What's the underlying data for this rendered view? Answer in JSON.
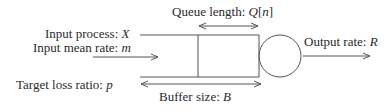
{
  "labels": {
    "input_process": {
      "text": "Input process: ",
      "var": "X"
    },
    "input_mean_rate": {
      "text": "Input mean rate: ",
      "var": "m"
    },
    "target_loss_ratio": {
      "text": "Target loss ratio: ",
      "var": "p"
    },
    "queue_length": {
      "text": "Queue length: ",
      "var": "Q",
      "index": "[n]",
      "index_var": "n"
    },
    "buffer_size": {
      "text": "Buffer size: ",
      "var": "B"
    },
    "output_rate": {
      "text": "Output rate: ",
      "var": "R"
    }
  },
  "colors": {
    "line": "#555555",
    "text": "#2a2a2a",
    "background": "#ffffff"
  }
}
